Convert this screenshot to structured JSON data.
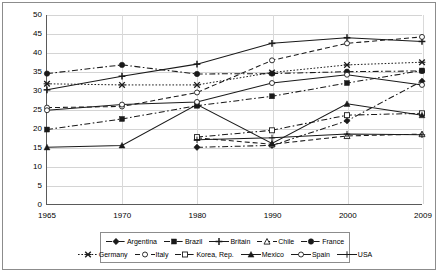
{
  "chart_data": {
    "type": "line",
    "title": "",
    "xlabel": "",
    "ylabel": "",
    "categories": [
      "1965",
      "1970",
      "1980",
      "1990",
      "2000",
      "2009"
    ],
    "ylim": [
      0,
      50
    ],
    "ytick_step": 5,
    "yticks": [
      "0",
      "5",
      "10",
      "15",
      "20",
      "25",
      "30",
      "35",
      "40",
      "45",
      "50"
    ],
    "grid": true,
    "legend_position": "bottom",
    "series": [
      {
        "name": "Argentina",
        "marker": "filled-diamond",
        "dash": "dashdot",
        "values": [
          null,
          null,
          15.0,
          15.5,
          22.0,
          32.5
        ]
      },
      {
        "name": "Brazil",
        "marker": "filled-square",
        "dash": "dashdot",
        "values": [
          19.7,
          22.5,
          26.0,
          28.5,
          32.0,
          35.3
        ]
      },
      {
        "name": "Britain",
        "marker": "plus",
        "dash": "solid",
        "values": [
          30.2,
          33.8,
          37.0,
          42.5,
          44.0,
          43.0
        ]
      },
      {
        "name": "Chile",
        "marker": "open-triangle",
        "dash": "dash",
        "values": [
          null,
          null,
          17.5,
          15.8,
          18.0,
          18.5
        ]
      },
      {
        "name": "France",
        "marker": "filled-circle",
        "dash": "dashdot",
        "values": [
          34.5,
          36.8,
          34.4,
          34.5,
          35.0,
          35.2
        ]
      },
      {
        "name": "Germany",
        "marker": "x-star",
        "dash": "dot",
        "values": [
          31.8,
          31.5,
          31.5,
          34.8,
          36.8,
          37.5
        ]
      },
      {
        "name": "Italy",
        "marker": "open-circle",
        "dash": "dash",
        "values": [
          25.5,
          25.8,
          29.5,
          38.0,
          42.5,
          44.2
        ]
      },
      {
        "name": "Korea, Rep.",
        "marker": "open-square",
        "dash": "dashdot",
        "values": [
          null,
          null,
          17.7,
          19.5,
          23.5,
          24.0
        ]
      },
      {
        "name": "Mexico",
        "marker": "filled-triangle",
        "dash": "solid",
        "values": [
          15.0,
          15.5,
          26.3,
          16.0,
          26.5,
          23.5
        ]
      },
      {
        "name": "Spain",
        "marker": "open-circle-2",
        "dash": "solid",
        "values": [
          24.8,
          26.3,
          27.0,
          32.0,
          34.2,
          31.5
        ]
      },
      {
        "name": "USA",
        "marker": "light-plus",
        "dash": "solid",
        "values": [
          null,
          null,
          17.0,
          17.5,
          18.5,
          18.3
        ]
      }
    ]
  },
  "legend": {
    "row1": [
      "Argentina",
      "Brazil",
      "Britain",
      "Chile",
      "France"
    ],
    "row2": [
      "Germany",
      "Italy",
      "Korea, Rep.",
      "Mexico",
      "Spain",
      "USA"
    ]
  },
  "colors": {
    "axis": "#5a5a5a",
    "grid": "#d4d4d4",
    "series": "#1a1a1a",
    "frame": "#8c8c8c",
    "background": "#ffffff"
  }
}
